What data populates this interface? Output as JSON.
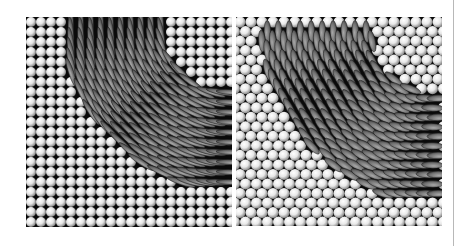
{
  "figure": {
    "panels": [
      {
        "id": "left",
        "description": "Square lattice of spheres with a quarter-annulus domain of aligned rods (vertical at top, bending to horizontal at right)",
        "lattice": "square",
        "pitch": 10,
        "cols": 21,
        "rows": 21,
        "defect_center": [
          210,
          0
        ],
        "defect_inner_radius": 75,
        "defect_outer_radius": 175,
        "background_color": "#0a0a0a",
        "sphere_color": "#e6e6e6",
        "rod_color": "#6a6a6a"
      },
      {
        "id": "right",
        "description": "Hexagonal lattice of spheres with a curved domain of tilted ellipsoids (rod-like particles) forming a bent band",
        "lattice": "hexagonal",
        "pitch": 11,
        "cols": 20,
        "rows": 22,
        "defect_center": [
          200,
          10
        ],
        "defect_inner_radius": 65,
        "defect_outer_radius": 175,
        "background_color": "#0a0a0a",
        "sphere_color": "#e8e8e8",
        "rod_color": "#707070"
      }
    ],
    "divider_color": "#b8b8b8"
  }
}
